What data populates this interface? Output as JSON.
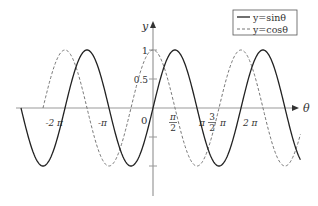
{
  "chart_data": {
    "type": "line",
    "title": "",
    "xlabel": "θ",
    "ylabel": "y",
    "grid": false,
    "legend_position": "top-right",
    "xlim": [
      -3.0,
      3.35
    ],
    "x_unit": "π",
    "ylim": [
      -1.5,
      1.1
    ],
    "x_ticks": [
      {
        "value": -2,
        "label": "-2 π"
      },
      {
        "value": -1,
        "label": "-π"
      },
      {
        "value": 0.5,
        "label_num": "π",
        "label_den": "2"
      },
      {
        "value": 1,
        "label": "π"
      },
      {
        "value": 1.5,
        "label_num": "3",
        "label_den": "2",
        "label_suffix": "π"
      },
      {
        "value": 2,
        "label": "2 π"
      }
    ],
    "origin_label": "0",
    "y_ticks": [
      {
        "value": 1,
        "label": "1"
      },
      {
        "value": 0.5,
        "label": "0.5"
      },
      {
        "value": -0.5,
        "label": ""
      },
      {
        "value": -1,
        "label": ""
      }
    ],
    "series": [
      {
        "name": "y=sinθ",
        "function": "sin",
        "style": "solid",
        "color": "#222222",
        "domain": [
          -3.0,
          3.35
        ]
      },
      {
        "name": "y=cosθ",
        "function": "cos",
        "style": "dashed",
        "color": "#777777",
        "domain": [
          -2.5,
          3.35
        ]
      }
    ]
  },
  "legend": {
    "items": [
      {
        "label": "y=sinθ",
        "style": "solid"
      },
      {
        "label": "y=cosθ",
        "style": "dashed"
      }
    ]
  },
  "axes": {
    "x_label": "θ",
    "y_label": "y",
    "origin": "0"
  }
}
